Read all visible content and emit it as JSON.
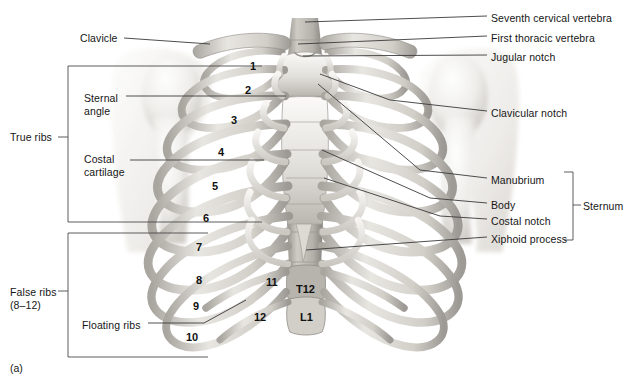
{
  "figure": {
    "caption": "(a)",
    "background_color": "#ffffff",
    "line_color": "#3a3a3a",
    "bone_light": "#f2f1ee",
    "bone_mid": "#b9b6b1",
    "bone_dark": "#8d8a86",
    "cartilage": "#d9d7d2"
  },
  "labels_left": [
    {
      "id": "clavicle",
      "text": "Clavicle",
      "x": 80,
      "y": 32
    },
    {
      "id": "sternal-angle",
      "text": "Sternal\nangle",
      "x": 84,
      "y": 92
    },
    {
      "id": "true-ribs",
      "text": "True ribs",
      "x": 10,
      "y": 131
    },
    {
      "id": "costal-cartilage",
      "text": "Costal\ncartilage",
      "x": 84,
      "y": 153
    },
    {
      "id": "false-ribs",
      "text": "False ribs\n(8–12)",
      "x": 10,
      "y": 286
    },
    {
      "id": "floating-ribs",
      "text": "Floating ribs",
      "x": 82,
      "y": 319
    }
  ],
  "labels_right": [
    {
      "id": "seventh-cervical-vertebra",
      "text": "Seventh cervical vertebra",
      "x": 491,
      "y": 12
    },
    {
      "id": "first-thoracic-vertebra",
      "text": "First thoracic vertebra",
      "x": 491,
      "y": 32
    },
    {
      "id": "jugular-notch",
      "text": "Jugular notch",
      "x": 491,
      "y": 51
    },
    {
      "id": "clavicular-notch",
      "text": "Clavicular notch",
      "x": 491,
      "y": 107
    },
    {
      "id": "manubrium",
      "text": "Manubrium",
      "x": 491,
      "y": 174
    },
    {
      "id": "body",
      "text": "Body",
      "x": 491,
      "y": 199
    },
    {
      "id": "costal-notch",
      "text": "Costal notch",
      "x": 491,
      "y": 215
    },
    {
      "id": "xiphoid-process",
      "text": "Xiphoid process",
      "x": 491,
      "y": 233
    },
    {
      "id": "sternum",
      "text": "Sternum",
      "x": 583,
      "y": 200
    }
  ],
  "rib_numbers": [
    {
      "n": "1",
      "x": 250,
      "y": 60
    },
    {
      "n": "2",
      "x": 245,
      "y": 84
    },
    {
      "n": "3",
      "x": 231,
      "y": 114
    },
    {
      "n": "4",
      "x": 218,
      "y": 146
    },
    {
      "n": "5",
      "x": 212,
      "y": 180
    },
    {
      "n": "6",
      "x": 203,
      "y": 212
    },
    {
      "n": "7",
      "x": 196,
      "y": 241
    },
    {
      "n": "8",
      "x": 196,
      "y": 274
    },
    {
      "n": "9",
      "x": 193,
      "y": 300
    },
    {
      "n": "10",
      "x": 186,
      "y": 331
    },
    {
      "n": "11",
      "x": 266,
      "y": 276
    },
    {
      "n": "12",
      "x": 254,
      "y": 311
    }
  ],
  "vertebra_markers": [
    {
      "id": "t12",
      "text": "T12",
      "x": 296,
      "y": 283
    },
    {
      "id": "l1",
      "text": "L1",
      "x": 300,
      "y": 311
    }
  ],
  "brackets": {
    "true_ribs": {
      "x_left": 68,
      "x_right": 262,
      "y_top": 66,
      "y_bottom": 222,
      "tick_y": 137
    },
    "false_ribs": {
      "x_left": 68,
      "x_right": 208,
      "y_top": 233,
      "y_bottom": 357,
      "tick_y": 291
    },
    "sternum": {
      "x": 573,
      "y_top": 172,
      "y_bottom": 240,
      "tick_y": 205
    }
  }
}
